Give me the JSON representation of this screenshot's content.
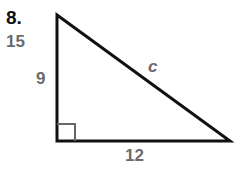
{
  "problem": {
    "number": "8.",
    "answer": "15"
  },
  "triangle": {
    "type": "right triangle",
    "legs": {
      "vertical": "9",
      "horizontal": "12"
    },
    "hypotenuse": "c",
    "right_angle_marker": true,
    "stroke_color": "#111111",
    "label_color": "#6b6b6b"
  }
}
